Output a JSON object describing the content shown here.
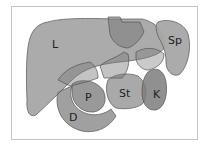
{
  "figure": {
    "type": "anatomical-diagram",
    "colors": {
      "organ_fill": "#8a8a8a",
      "organ_stroke": "#555555",
      "spleen_fill": "#a6a6a6",
      "frame_border": "#c4c4c4",
      "background": "#ffffff"
    },
    "labels": [
      {
        "id": "L",
        "text": "L",
        "organ": "liver"
      },
      {
        "id": "Sp",
        "text": "Sp",
        "organ": "spleen"
      },
      {
        "id": "St",
        "text": "St",
        "organ": "stomach"
      },
      {
        "id": "P",
        "text": "P",
        "organ": "pancreas"
      },
      {
        "id": "K",
        "text": "K",
        "organ": "kidney"
      },
      {
        "id": "D",
        "text": "D",
        "organ": "duodenum"
      }
    ]
  }
}
